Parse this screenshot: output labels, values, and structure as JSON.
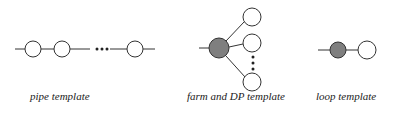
{
  "diagram": {
    "templates": [
      {
        "id": "pipe",
        "label": "pipe template",
        "nodes": [
          {
            "kind": "open"
          },
          {
            "kind": "open"
          },
          {
            "kind": "ellipsis"
          },
          {
            "kind": "open"
          }
        ]
      },
      {
        "id": "farm",
        "label": "farm and DP template",
        "root": {
          "kind": "filled"
        },
        "branches": [
          {
            "kind": "open"
          },
          {
            "kind": "open"
          },
          {
            "kind": "ellipsis"
          },
          {
            "kind": "open"
          }
        ]
      },
      {
        "id": "loop",
        "label": "loop template",
        "nodes": [
          {
            "kind": "filled"
          },
          {
            "kind": "open"
          }
        ]
      }
    ],
    "colors": {
      "filled_node": "#7f7f7f",
      "open_node": "#ffffff",
      "stroke": "#333333"
    }
  }
}
